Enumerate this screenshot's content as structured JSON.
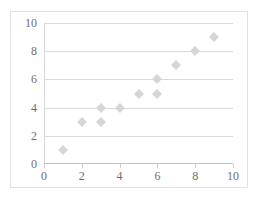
{
  "chart_data": {
    "type": "scatter",
    "title": "",
    "xlabel": "",
    "ylabel": "",
    "xlim": [
      0,
      10
    ],
    "ylim": [
      0,
      10
    ],
    "xticks": [
      0,
      2,
      4,
      6,
      8,
      10
    ],
    "yticks": [
      0,
      2,
      4,
      6,
      8,
      10
    ],
    "xtick_labels": [
      "0",
      "2",
      "4",
      "6",
      "8",
      "10"
    ],
    "ytick_labels": [
      "0",
      "2",
      "4",
      "6",
      "8",
      "10"
    ],
    "grid": {
      "horizontal": true,
      "vertical": false,
      "color": "#d9d9d9"
    },
    "legend": {
      "visible": false,
      "position": "none",
      "entries": []
    },
    "marker": {
      "shape": "diamond",
      "color": "#d6d6d6",
      "size": 7
    },
    "points": [
      {
        "x": 1,
        "y": 1
      },
      {
        "x": 2,
        "y": 3
      },
      {
        "x": 3,
        "y": 4
      },
      {
        "x": 3,
        "y": 3
      },
      {
        "x": 4,
        "y": 4
      },
      {
        "x": 5,
        "y": 5
      },
      {
        "x": 6,
        "y": 6
      },
      {
        "x": 6,
        "y": 5
      },
      {
        "x": 7,
        "y": 7
      },
      {
        "x": 8,
        "y": 8
      },
      {
        "x": 9,
        "y": 9
      }
    ],
    "series": [
      {
        "name": "",
        "x": [
          1,
          2,
          3,
          3,
          4,
          5,
          6,
          6,
          7,
          8,
          9
        ],
        "values": [
          1,
          3,
          4,
          3,
          4,
          5,
          6,
          5,
          7,
          8,
          9
        ]
      }
    ],
    "colors": {
      "marker": "#d6d6d6",
      "gridline": "#d9d9d9",
      "axis": "#bfbfbf",
      "tick_label": "#6e6e6e",
      "frame_border": "#e3e3e3",
      "background": "#ffffff"
    }
  }
}
